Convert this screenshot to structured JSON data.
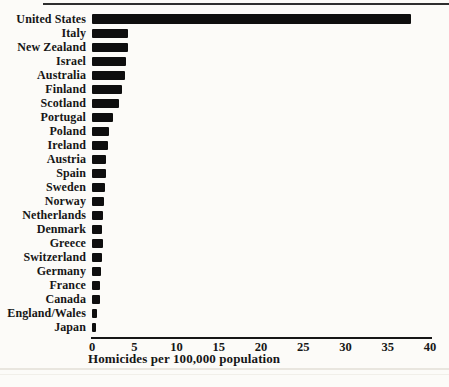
{
  "page": {
    "background": "#fcfbf8",
    "top_rule_color": "#2e2e2e",
    "scan_line_color": "#e9e6df",
    "scan_line2_color": "#f1efe9"
  },
  "chart_data": {
    "type": "bar",
    "orientation": "horizontal",
    "title": "",
    "xlabel": "Homicides per 100,000 population",
    "ylabel": "",
    "xlim": [
      0,
      40
    ],
    "x_ticks": [
      0,
      5,
      10,
      15,
      20,
      25,
      30,
      35,
      40
    ],
    "grid": false,
    "legend": false,
    "bar_color": "#0e0e0e",
    "axis_color": "#161616",
    "categories": [
      "United States",
      "Italy",
      "New Zealand",
      "Israel",
      "Australia",
      "Finland",
      "Scotland",
      "Portugal",
      "Poland",
      "Ireland",
      "Austria",
      "Spain",
      "Sweden",
      "Norway",
      "Netherlands",
      "Denmark",
      "Greece",
      "Switzerland",
      "Germany",
      "France",
      "Canada",
      "England/Wales",
      "Japan"
    ],
    "values": [
      37.7,
      4.3,
      4.2,
      4.0,
      3.9,
      3.5,
      3.2,
      2.5,
      2.0,
      1.9,
      1.7,
      1.6,
      1.5,
      1.4,
      1.3,
      1.2,
      1.3,
      1.2,
      1.1,
      1.0,
      0.9,
      0.6,
      0.5
    ]
  }
}
